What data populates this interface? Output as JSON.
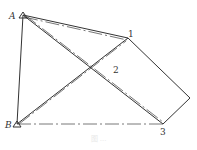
{
  "diagram": {
    "points": {
      "A": {
        "label": "A",
        "x": 23,
        "y": 15
      },
      "B": {
        "label": "B",
        "x": 17,
        "y": 124
      },
      "p1": {
        "label": "1",
        "x": 128,
        "y": 38
      },
      "p2": {
        "label": "2",
        "x": 115,
        "y": 70
      },
      "p3": {
        "label": "3",
        "x": 163,
        "y": 124
      },
      "corner": {
        "x": 190,
        "y": 98
      }
    },
    "caption": "图 ..."
  }
}
